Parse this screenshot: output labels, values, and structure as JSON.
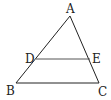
{
  "diagram": {
    "type": "geometry",
    "points": {
      "A": {
        "label": "A",
        "x": 70,
        "y": 16,
        "lx": 66,
        "ly": 13
      },
      "B": {
        "label": "B",
        "x": 16,
        "y": 83,
        "lx": 6,
        "ly": 95
      },
      "C": {
        "label": "C",
        "x": 99,
        "y": 83,
        "lx": 98,
        "ly": 96
      },
      "D": {
        "label": "D",
        "x": 36,
        "y": 59,
        "lx": 25,
        "ly": 63
      },
      "E": {
        "label": "E",
        "x": 90,
        "y": 59,
        "lx": 92,
        "ly": 63
      }
    },
    "segments": [
      "AB",
      "AC",
      "BC",
      "DE"
    ],
    "colors": {
      "stroke": "#222222",
      "de_stroke": "#555555",
      "background": "#ffffff"
    }
  }
}
